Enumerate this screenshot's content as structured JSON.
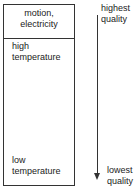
{
  "diagram": {
    "box": {
      "top_section": {
        "line1": "motion,",
        "line2": "electricity"
      },
      "upper_label": {
        "line1": "high",
        "line2": "temperature"
      },
      "lower_label": {
        "line1": "low",
        "line2": "temperature"
      }
    },
    "scale": {
      "top": {
        "line1": "highest",
        "line2": "quality"
      },
      "bottom": {
        "line1": "lowest",
        "line2": "quality"
      },
      "arrow_direction": "down"
    }
  }
}
